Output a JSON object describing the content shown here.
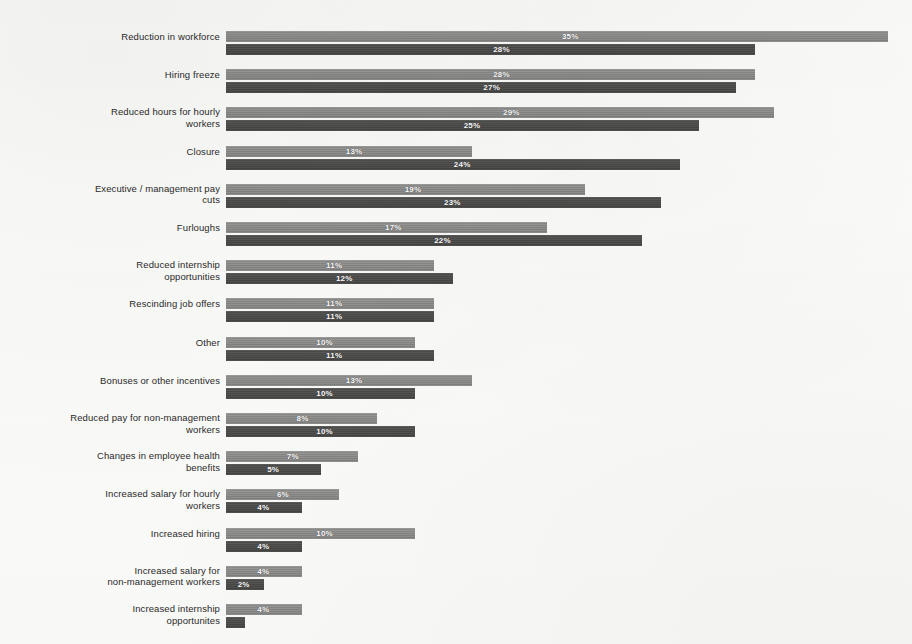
{
  "figure": {
    "background_color": "#fbfbf9",
    "series_colors": {
      "light": "#8b8b8a",
      "dark": "#4b4b4a"
    }
  },
  "chart_data": {
    "type": "bar",
    "orientation": "horizontal",
    "title": "",
    "subtitle": "",
    "xlabel": "",
    "ylabel": "",
    "xlim": [
      0,
      36
    ],
    "grid": false,
    "legend_position": "none",
    "value_label_suffix": "%",
    "categories": [
      "Reduction in workforce",
      "Hiring freeze",
      "Reduced hours for hourly workers",
      "Closure",
      "Executive / management pay cuts",
      "Furloughs",
      "Reduced internship opportunities",
      "Rescinding job offers",
      "Other",
      "Bonuses or other incentives",
      "Reduced pay for non-management workers",
      "Changes in employee health benefits",
      "Increased salary for hourly workers",
      "Increased hiring",
      "Increased salary for non-management workers",
      "Increased internship opportunites"
    ],
    "series": [
      {
        "name": "light",
        "values": [
          35,
          28,
          29,
          13,
          19,
          17,
          11,
          11,
          10,
          13,
          8,
          7,
          6,
          10,
          4,
          4
        ],
        "labels": [
          "35%",
          "28%",
          "29%",
          "13%",
          "19%",
          "17%",
          "11%",
          "11%",
          "10%",
          "13%",
          "8%",
          "7%",
          "6%",
          "10%",
          "4%",
          "4%"
        ]
      },
      {
        "name": "dark",
        "values": [
          28,
          27,
          25,
          24,
          23,
          22,
          12,
          11,
          11,
          10,
          10,
          5,
          4,
          4,
          2,
          1
        ],
        "labels": [
          "28%",
          "27%",
          "25%",
          "24%",
          "23%",
          "22%",
          "12%",
          "11%",
          "11%",
          "10%",
          "10%",
          "5%",
          "4%",
          "4%",
          "2%",
          ""
        ]
      }
    ]
  },
  "rows": [
    {
      "label_lines": [
        "Reduction in workforce"
      ]
    },
    {
      "label_lines": [
        "Hiring freeze"
      ]
    },
    {
      "label_lines": [
        "Reduced hours for hourly",
        "workers"
      ]
    },
    {
      "label_lines": [
        "Closure"
      ]
    },
    {
      "label_lines": [
        "Executive / management pay",
        "cuts"
      ]
    },
    {
      "label_lines": [
        "Furloughs"
      ]
    },
    {
      "label_lines": [
        "Reduced internship",
        "opportunities"
      ]
    },
    {
      "label_lines": [
        "Rescinding job offers"
      ]
    },
    {
      "label_lines": [
        "Other"
      ]
    },
    {
      "label_lines": [
        "Bonuses or other incentives"
      ]
    },
    {
      "label_lines": [
        "Reduced pay for non-management",
        "workers"
      ]
    },
    {
      "label_lines": [
        "Changes in employee health",
        "benefits"
      ]
    },
    {
      "label_lines": [
        "Increased salary for hourly",
        "workers"
      ]
    },
    {
      "label_lines": [
        "Increased hiring"
      ]
    },
    {
      "label_lines": [
        "Increased salary for",
        "non-management workers"
      ]
    },
    {
      "label_lines": [
        "Increased internship",
        "opportunites"
      ]
    }
  ]
}
